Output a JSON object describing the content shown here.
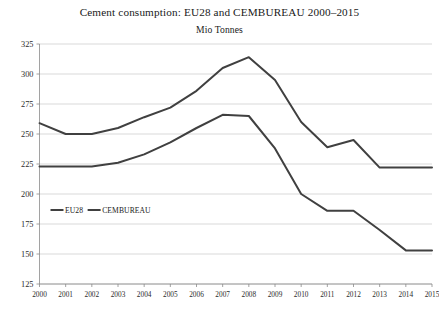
{
  "chart_data": {
    "type": "line",
    "title": "Cement consumption: EU28 and CEMBUREAU 2000–2015",
    "subtitle": "Mio Tonnes",
    "xlabel": "",
    "ylabel": "",
    "unit": "Mio Tonnes",
    "categories": [
      "2000",
      "2001",
      "2002",
      "2003",
      "2004",
      "2005",
      "2006",
      "2007",
      "2008",
      "2009",
      "2010",
      "2011",
      "2012",
      "2013",
      "2014",
      "2015"
    ],
    "x": [
      2000,
      2001,
      2002,
      2003,
      2004,
      2005,
      2006,
      2007,
      2008,
      2009,
      2010,
      2011,
      2012,
      2013,
      2014,
      2015
    ],
    "series": [
      {
        "name": "EU28",
        "color": "#404040",
        "values": [
          223,
          223,
          223,
          226,
          233,
          243,
          255,
          266,
          265,
          238,
          200,
          186,
          186,
          170,
          153,
          153
        ]
      },
      {
        "name": "CEMBUREAU",
        "color": "#404040",
        "values": [
          259,
          250,
          250,
          255,
          264,
          272,
          286,
          305,
          314,
          295,
          260,
          239,
          245,
          222,
          222,
          222
        ]
      }
    ],
    "ylim": [
      125,
      325
    ],
    "yticks": [
      125,
      150,
      175,
      200,
      225,
      250,
      275,
      300,
      325
    ],
    "ytick_labels": [
      "125",
      "150",
      "175",
      "200",
      "225",
      "250",
      "275",
      "300",
      "325"
    ],
    "xlim": [
      2000,
      2015
    ],
    "grid": "horizontal",
    "legend_position": "inside-lower-left",
    "legend_entries": [
      "EU28",
      "CEMBUREAU"
    ]
  }
}
